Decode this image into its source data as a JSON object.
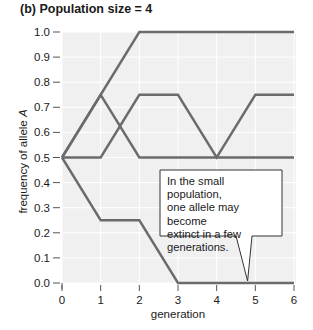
{
  "title": "(b) Population size = 4",
  "chart_data": {
    "type": "line",
    "title": "(b) Population size = 4",
    "xlabel": "generation",
    "ylabel": "frequency of allele A",
    "x": [
      0,
      1,
      2,
      3,
      4,
      5,
      6
    ],
    "xlim": [
      0,
      6
    ],
    "ylim": [
      0.0,
      1.0
    ],
    "x_ticks": [
      "0",
      "1",
      "2",
      "3",
      "4",
      "5",
      "6"
    ],
    "y_ticks": [
      "0.0",
      "0.1",
      "0.2",
      "0.3",
      "0.4",
      "0.5",
      "0.6",
      "0.7",
      "0.8",
      "0.9",
      "1.0"
    ],
    "grid": true,
    "legend": "none",
    "series": [
      {
        "name": "population 1",
        "values": [
          0.5,
          0.75,
          1.0,
          1.0,
          1.0,
          1.0,
          1.0
        ]
      },
      {
        "name": "population 2",
        "values": [
          0.5,
          0.75,
          0.5,
          0.5,
          0.5,
          0.5,
          0.5
        ]
      },
      {
        "name": "population 3",
        "values": [
          0.5,
          0.5,
          0.75,
          0.75,
          0.5,
          0.75,
          0.75
        ]
      },
      {
        "name": "population 4",
        "values": [
          0.5,
          0.25,
          0.25,
          0.0,
          0.0,
          0.0,
          0.0
        ]
      }
    ],
    "annotations": [
      {
        "text": "In the small population, one allele may become extinct in a few generations.",
        "points_to": {
          "x": 4.8,
          "y": 0.0
        }
      }
    ]
  },
  "callout": {
    "text": "In the small population,\none allele may become\nextinct in a few\ngenerations."
  },
  "colors": {
    "plot_background": "#f0f0f0",
    "gridline": "#ffffff",
    "line": "#6b6b6b",
    "axis": "#555555",
    "text": "#1a1a1a"
  }
}
